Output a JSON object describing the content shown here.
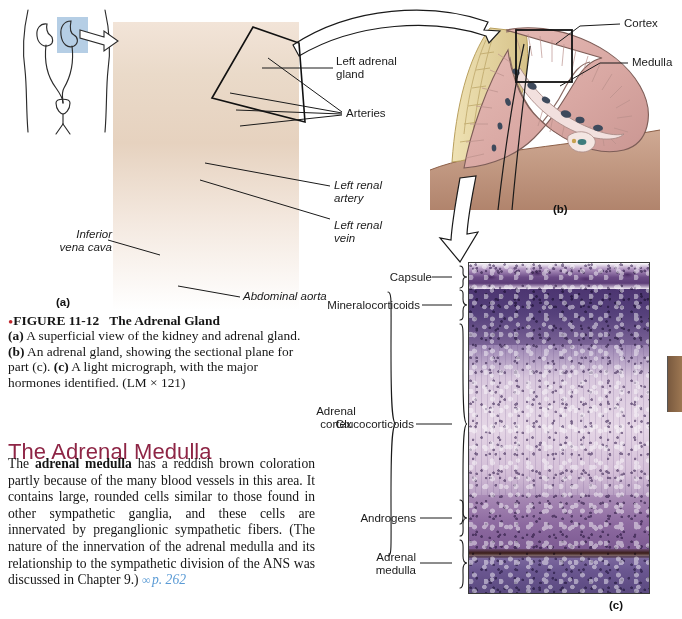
{
  "figure": {
    "panel_a_id": "(a)",
    "panel_b_id": "(b)",
    "panel_c_id": "(c)",
    "labels_a": {
      "left_adrenal_gland": "Left adrenal\ngland",
      "arteries": "Arteries",
      "left_renal_artery": "Left renal\nartery",
      "left_renal_vein": "Left renal\nvein",
      "inferior_vena_cava": "Inferior\nvena cava",
      "abdominal_aorta": "Abdominal aorta"
    },
    "labels_b": {
      "cortex": "Cortex",
      "medulla": "Medulla"
    },
    "labels_c": {
      "capsule": "Capsule",
      "mineralocorticoids": "Mineralocorticoids",
      "adrenal_cortex": "Adrenal\ncortex",
      "glucocorticoids": "Glucocorticoids",
      "androgens": "Androgens",
      "adrenal_medulla": "Adrenal\nmedulla"
    }
  },
  "caption": {
    "bullet": "•",
    "figure_number": "FIGURE 11-12",
    "figure_title": "The Adrenal Gland",
    "part_a_tag": "(a)",
    "part_a_text": " A superficial view of the kidney and adrenal gland. ",
    "part_b_tag": "(b)",
    "part_b_text": " An adrenal gland, showing the sectional plane for part (c). ",
    "part_c_tag": "(c)",
    "part_c_text": " A light micrograph, with the major hormones identified. (LM × 121)"
  },
  "section": {
    "heading": "The Adrenal Medulla",
    "paragraph_lead": "The ",
    "paragraph_bold": "adrenal medulla",
    "paragraph_rest": " has a reddish brown coloration partly because of the many blood vessels in this area. It contains large, rounded cells similar to those found in other sympathetic ganglia, and these cells are innervated by preganglionic sympathetic fibers. (The nature of the innervation of the adrenal medulla and its relationship to the sympathetic division of the ANS was discussed in Chapter 9.) ",
    "crossref_glyph": "∞",
    "crossref": "p. 262"
  },
  "colors": {
    "heading": "#8e2545",
    "bullet": "#c0272d",
    "crossref": "#5b9bd5",
    "label_text": "#1a1a1a",
    "micrograph_capsule": "#5d3d78",
    "micrograph_mineralocorticoids": "#4c3571",
    "micrograph_glucocorticoids": "#d8c7dd",
    "micrograph_androgens": "#8d6aa0",
    "micrograph_medulla": "#6a5690",
    "kidney": "#c08a6e",
    "adrenal_fat": "#ddc98c",
    "artery": "#c0392b",
    "vein": "#2e6fa7",
    "adrenal_section": "#e0b4b0",
    "highlight_box": "#a8c6e0"
  },
  "icons": {
    "zoom_arrow": "curved-arrow-icon",
    "section_arrow": "down-arrow-icon",
    "crossref_link": "link-glyph-icon"
  }
}
